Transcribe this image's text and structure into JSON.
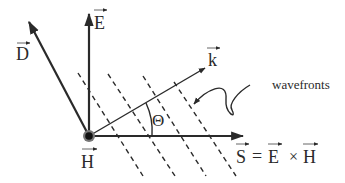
{
  "figure": {
    "type": "electromagnetic wave vector diagram",
    "labels": {
      "D": "D",
      "E": "E",
      "k": "k",
      "H": "H",
      "theta": "Θ",
      "wavefronts": "wavefronts",
      "poynting_S": "S",
      "equals": "=",
      "poynting_E": "E",
      "cross": "×",
      "poynting_H": "H"
    },
    "vectors": [
      {
        "name": "D",
        "direction": "up-left"
      },
      {
        "name": "E",
        "direction": "up"
      },
      {
        "name": "k",
        "direction": "up-right"
      },
      {
        "name": "S",
        "direction": "right",
        "definition": "S = E × H"
      },
      {
        "name": "H",
        "direction": "out of page"
      }
    ],
    "angle_label": "Θ",
    "wavefront_count": 4,
    "colors": {
      "ink": "#2a2a2a",
      "background": "#ffffff",
      "h_dot_ring": "#777777"
    }
  }
}
